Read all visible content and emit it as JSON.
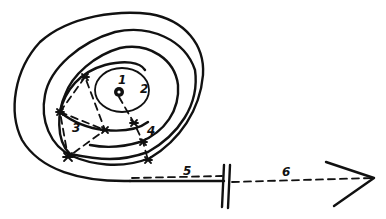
{
  "diagram": {
    "type": "hand-drawn spiral path diagram",
    "labels": {
      "p1": "1",
      "p2": "2",
      "p3": "3",
      "p4": "4",
      "p5": "5",
      "p6": "6"
    },
    "elements": [
      "center dot (origin)",
      "inward spiral (solid line)",
      "dashed search legs between spiral crossings (marked with stars)",
      "straight exit line with break mark",
      "dashed continuation ending in arrowhead"
    ],
    "colors": {
      "ink": "#111111",
      "background": "#ffffff"
    }
  }
}
